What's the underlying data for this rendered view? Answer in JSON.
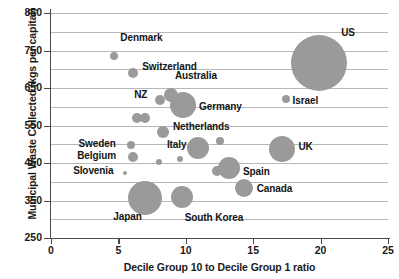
{
  "chart_data": {
    "type": "scatter",
    "title": "",
    "xlabel": "Decile Group 10 to Decile Group 1 ratio",
    "ylabel": "Municipal Waste Collected (kgs per capital)",
    "xlim": [
      0,
      25
    ],
    "ylim": [
      250,
      850
    ],
    "xticks": [
      0,
      5,
      10,
      15,
      20,
      25
    ],
    "yticks": [
      250,
      350,
      450,
      550,
      650,
      750,
      850
    ],
    "gridlines": [
      300,
      350,
      400,
      450,
      500,
      550,
      600,
      650,
      700,
      750,
      800,
      850
    ],
    "grid": true,
    "legend": "none",
    "bubble_color": "#9a9a9a",
    "note": "Bubble area encodes a third variable (population / total waste).",
    "points": [
      {
        "name": "Denmark",
        "x": 4.7,
        "y": 735,
        "size": 4,
        "label_dx": 6,
        "label_dy": -18,
        "label_align": "left"
      },
      {
        "name": "Switzerland",
        "x": 6.1,
        "y": 690,
        "size": 5,
        "label_dx": 9,
        "label_dy": -6,
        "label_align": "left"
      },
      {
        "name": "Australia",
        "x": 8.9,
        "y": 631,
        "size": 7,
        "label_dx": 4,
        "label_dy": -19,
        "label_align": "left"
      },
      {
        "name": "NZ",
        "x": 8.1,
        "y": 618,
        "size": 5,
        "label_dx": -26,
        "label_dy": -5,
        "label_align": "left"
      },
      {
        "name": "Germany",
        "x": 9.8,
        "y": 605,
        "size": 13,
        "label_dx": 16,
        "label_dy": 2,
        "label_align": "left"
      },
      {
        "name": "US",
        "x": 19.9,
        "y": 717,
        "size": 28,
        "label_dx": 22,
        "label_dy": -30,
        "label_align": "left"
      },
      {
        "name": "Israel",
        "x": 17.4,
        "y": 620,
        "size": 4,
        "label_dx": 7,
        "label_dy": 2,
        "label_align": "left"
      },
      {
        "name": "Netherlands",
        "x": 8.3,
        "y": 532,
        "size": 6,
        "label_dx": 10,
        "label_dy": -5,
        "label_align": "left"
      },
      {
        "name": "Italy",
        "x": 10.9,
        "y": 490,
        "size": 11,
        "label_dx": -31,
        "label_dy": -3,
        "label_align": "left"
      },
      {
        "name": "UK",
        "x": 17.1,
        "y": 488,
        "size": 13,
        "label_dx": 17,
        "label_dy": -2,
        "label_align": "left"
      },
      {
        "name": "Spain",
        "x": 13.2,
        "y": 438,
        "size": 11,
        "label_dx": 14,
        "label_dy": 4,
        "label_align": "left"
      },
      {
        "name": "Sweden",
        "x": 5.9,
        "y": 498,
        "size": 4,
        "label_dx": -52,
        "label_dy": -1,
        "label_align": "left"
      },
      {
        "name": "Belgium",
        "x": 6.1,
        "y": 466,
        "size": 5,
        "label_dx": -56,
        "label_dy": -1,
        "label_align": "left"
      },
      {
        "name": "Slovenia",
        "x": 5.5,
        "y": 423,
        "size": 2,
        "label_dx": -52,
        "label_dy": -2,
        "label_align": "left"
      },
      {
        "name": "Canada",
        "x": 14.3,
        "y": 384,
        "size": 9,
        "label_dx": 13,
        "label_dy": 1,
        "label_align": "left"
      },
      {
        "name": "Japan",
        "x": 7.0,
        "y": 357,
        "size": 17,
        "label_dx": -32,
        "label_dy": 19,
        "label_align": "left"
      },
      {
        "name": "South Korea",
        "x": 9.7,
        "y": 360,
        "size": 11,
        "label_dx": 3,
        "label_dy": 21,
        "label_align": "left"
      }
    ],
    "unlabeled_points": [
      {
        "x": 6.4,
        "y": 570,
        "size": 5
      },
      {
        "x": 7.0,
        "y": 570,
        "size": 5
      },
      {
        "x": 12.5,
        "y": 508,
        "size": 4
      },
      {
        "x": 9.6,
        "y": 462,
        "size": 3
      },
      {
        "x": 12.3,
        "y": 428,
        "size": 5
      },
      {
        "x": 8.0,
        "y": 452,
        "size": 3
      }
    ]
  }
}
